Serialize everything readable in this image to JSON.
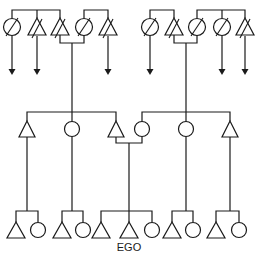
{
  "diagram": {
    "type": "kinship-chart",
    "colors": {
      "line": "#1a1a1a",
      "background": "#ffffff"
    },
    "legend_symbols": {
      "triangle": "male",
      "circle": "female",
      "slash": "deceased",
      "arrow": "descent continues"
    },
    "generations": [
      {
        "level": "grandparents",
        "members": [
          {
            "id": "g1",
            "shape": "circle",
            "x": 12,
            "deceased": true,
            "arrow": true
          },
          {
            "id": "g2",
            "shape": "triangle",
            "x": 37,
            "deceased": true,
            "arrow": true
          },
          {
            "id": "g3",
            "shape": "triangle",
            "x": 60,
            "deceased": true,
            "arrow": false
          },
          {
            "id": "g4",
            "shape": "circle",
            "x": 84,
            "deceased": true,
            "arrow": false
          },
          {
            "id": "g5",
            "shape": "triangle",
            "x": 108,
            "deceased": true,
            "arrow": true
          },
          {
            "id": "g6",
            "shape": "circle",
            "x": 150,
            "deceased": true,
            "arrow": true
          },
          {
            "id": "g7",
            "shape": "triangle",
            "x": 174,
            "deceased": true,
            "arrow": false
          },
          {
            "id": "g8",
            "shape": "circle",
            "x": 197,
            "deceased": true,
            "arrow": false
          },
          {
            "id": "g9",
            "shape": "circle",
            "x": 222,
            "deceased": true,
            "arrow": true
          },
          {
            "id": "g10",
            "shape": "triangle",
            "x": 245,
            "deceased": true,
            "arrow": true
          }
        ]
      },
      {
        "level": "parents",
        "members": [
          {
            "id": "p1",
            "shape": "triangle",
            "x": 27
          },
          {
            "id": "p2",
            "shape": "circle",
            "x": 72
          },
          {
            "id": "p3",
            "shape": "triangle",
            "x": 116
          },
          {
            "id": "p4",
            "shape": "circle",
            "x": 142
          },
          {
            "id": "p5",
            "shape": "circle",
            "x": 186
          },
          {
            "id": "p6",
            "shape": "triangle",
            "x": 230
          }
        ]
      },
      {
        "level": "ego-generation",
        "members": [
          {
            "id": "c1",
            "shape": "triangle",
            "x": 16
          },
          {
            "id": "c2",
            "shape": "circle",
            "x": 38
          },
          {
            "id": "c3",
            "shape": "triangle",
            "x": 62
          },
          {
            "id": "c4",
            "shape": "circle",
            "x": 83
          },
          {
            "id": "c5",
            "shape": "triangle",
            "x": 101
          },
          {
            "id": "c6",
            "shape": "triangle",
            "x": 129,
            "label": "EGO"
          },
          {
            "id": "c7",
            "shape": "circle",
            "x": 152
          },
          {
            "id": "c8",
            "shape": "triangle",
            "x": 172
          },
          {
            "id": "c9",
            "shape": "circle",
            "x": 193
          },
          {
            "id": "c10",
            "shape": "triangle",
            "x": 216
          },
          {
            "id": "c11",
            "shape": "circle",
            "x": 239
          }
        ]
      }
    ],
    "ego_label": "EGO"
  }
}
